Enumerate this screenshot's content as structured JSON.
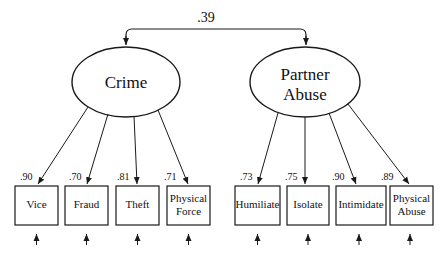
{
  "diagram": {
    "type": "structural-equation-model",
    "correlation": {
      "value": ".39",
      "between": [
        "Crime",
        "Partner Abuse"
      ]
    },
    "latents": [
      {
        "id": "crime",
        "label_lines": [
          "Crime"
        ],
        "indicators": [
          {
            "label_lines": [
              "Vice"
            ],
            "loading": ".90"
          },
          {
            "label_lines": [
              "Fraud"
            ],
            "loading": ".70"
          },
          {
            "label_lines": [
              "Theft"
            ],
            "loading": ".81"
          },
          {
            "label_lines": [
              "Physical",
              "Force"
            ],
            "loading": ".71"
          }
        ]
      },
      {
        "id": "partner-abuse",
        "label_lines": [
          "Partner",
          "Abuse"
        ],
        "indicators": [
          {
            "label_lines": [
              "Humiliate"
            ],
            "loading": ".73"
          },
          {
            "label_lines": [
              "Isolate"
            ],
            "loading": ".75"
          },
          {
            "label_lines": [
              "Intimidate"
            ],
            "loading": ".90"
          },
          {
            "label_lines": [
              "Physical",
              "Abuse"
            ],
            "loading": ".89"
          }
        ]
      }
    ],
    "colors": {
      "line": "#1a1a1a",
      "text": "#111111",
      "background": "#ffffff"
    }
  }
}
